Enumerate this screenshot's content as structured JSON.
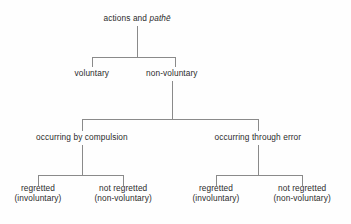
{
  "diagram": {
    "type": "tree",
    "background_color": "#fefefe",
    "line_color": "#8a8a8a",
    "text_color": "#2b2b2b",
    "nodes": {
      "root": {
        "id": "root",
        "level": 0,
        "text_plain": "actions and pathē",
        "segments": [
          {
            "text": "actions and ",
            "italic": false
          },
          {
            "text": "pathē",
            "italic": true
          }
        ],
        "x": 137,
        "y": 18
      },
      "voluntary": {
        "id": "voluntary",
        "level": 1,
        "line1": "voluntary",
        "line2": "",
        "x": 92,
        "y": 73
      },
      "non_voluntary": {
        "id": "non-voluntary",
        "level": 1,
        "line1": "non-voluntary",
        "line2": "",
        "x": 172,
        "y": 73
      },
      "compulsion": {
        "id": "occurring-by-compulsion",
        "level": 2,
        "line1": "occurring by compulsion",
        "line2": "",
        "x": 82,
        "y": 137
      },
      "error": {
        "id": "occurring-through-error",
        "level": 2,
        "line1": "occurring through error",
        "line2": "",
        "x": 258,
        "y": 137
      },
      "leaf_1": {
        "id": "compulsion-regretted",
        "level": 3,
        "line1": "regretted",
        "line2": "(involuntary)",
        "x": 38,
        "y": 193
      },
      "leaf_2": {
        "id": "compulsion-not-regretted",
        "level": 3,
        "line1": "not regretted",
        "line2": "(non-voluntary)",
        "x": 123,
        "y": 193
      },
      "leaf_3": {
        "id": "error-regretted",
        "level": 3,
        "line1": "regretted",
        "line2": "(involuntary)",
        "x": 216,
        "y": 193
      },
      "leaf_4": {
        "id": "error-not-regretted",
        "level": 3,
        "line1": "not regretted",
        "line2": "(non-voluntary)",
        "x": 302,
        "y": 193
      }
    },
    "edges": [
      {
        "name": "root-stem",
        "x1": 137,
        "y1": 26,
        "x2": 137,
        "y2": 57
      },
      {
        "name": "level1-bar",
        "x1": 92,
        "y1": 57,
        "x2": 175,
        "y2": 57
      },
      {
        "name": "voluntary-drop",
        "x1": 92,
        "y1": 57,
        "x2": 92,
        "y2": 67
      },
      {
        "name": "non-voluntary-drop",
        "x1": 175,
        "y1": 57,
        "x2": 175,
        "y2": 67
      },
      {
        "name": "non-voluntary-stem",
        "x1": 172,
        "y1": 81,
        "x2": 172,
        "y2": 119
      },
      {
        "name": "level2-bar",
        "x1": 82,
        "y1": 119,
        "x2": 258,
        "y2": 119
      },
      {
        "name": "compulsion-drop",
        "x1": 82,
        "y1": 119,
        "x2": 82,
        "y2": 131
      },
      {
        "name": "error-drop",
        "x1": 258,
        "y1": 119,
        "x2": 258,
        "y2": 131
      },
      {
        "name": "compulsion-stem",
        "x1": 82,
        "y1": 145,
        "x2": 82,
        "y2": 175
      },
      {
        "name": "left-leaf-bar",
        "x1": 38,
        "y1": 175,
        "x2": 123,
        "y2": 175
      },
      {
        "name": "leaf1-drop",
        "x1": 38,
        "y1": 175,
        "x2": 38,
        "y2": 186
      },
      {
        "name": "leaf2-drop",
        "x1": 123,
        "y1": 175,
        "x2": 123,
        "y2": 186
      },
      {
        "name": "error-stem",
        "x1": 258,
        "y1": 145,
        "x2": 258,
        "y2": 175
      },
      {
        "name": "right-leaf-bar",
        "x1": 216,
        "y1": 175,
        "x2": 302,
        "y2": 175
      },
      {
        "name": "leaf3-drop",
        "x1": 216,
        "y1": 175,
        "x2": 216,
        "y2": 186
      },
      {
        "name": "leaf4-drop",
        "x1": 302,
        "y1": 175,
        "x2": 302,
        "y2": 186
      }
    ]
  }
}
